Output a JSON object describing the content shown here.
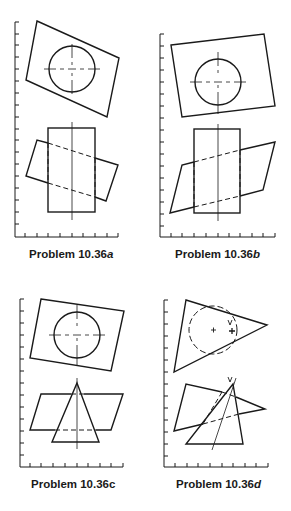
{
  "figure": {
    "colors": {
      "line": "#1a1a1a",
      "background": "#ffffff"
    },
    "panels": [
      {
        "id": "a",
        "caption_prefix": "Problem 10.36",
        "caption_suffix": "a",
        "top_view": {
          "shape": "rotated-rectangle with circle",
          "features": [
            "circle",
            "center-lines"
          ]
        },
        "front_view": {
          "shape": "vertical rectangle intersected by slanted rectangle",
          "hidden_lines": "dashed"
        }
      },
      {
        "id": "b",
        "caption_prefix": "Problem 10.36",
        "caption_suffix": "b",
        "top_view": {
          "shape": "skewed rectangle with circle",
          "features": [
            "circle",
            "center-lines"
          ]
        },
        "front_view": {
          "shape": "vertical rectangle intersected by parallelogram",
          "hidden_lines": "dashed"
        }
      },
      {
        "id": "c",
        "caption_prefix": "Problem 10.36",
        "caption_suffix": "c",
        "top_view": {
          "shape": "skewed rectangle with circle",
          "features": [
            "circle",
            "center-lines"
          ]
        },
        "front_view": {
          "shape": "parallelogram intersected by triangle (cone)",
          "hidden_lines": "dashed"
        }
      },
      {
        "id": "d",
        "caption_prefix": "Problem 10.36",
        "caption_suffix": "d",
        "top_view": {
          "shape": "triangle with dashed circle",
          "features": [
            "dashed-circle",
            "center-mark",
            "apex-mark"
          ],
          "apex_label": "V"
        },
        "front_view": {
          "shape": "quadrilateral intersected by triangle (oblique cone)",
          "hidden_lines": "dashed",
          "apex_label": "V"
        }
      }
    ]
  }
}
